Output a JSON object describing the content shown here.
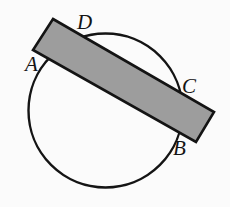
{
  "figure": {
    "background_color": "#fbfbfb",
    "stroke_color": "#141414",
    "labels": [
      {
        "id": "A",
        "text": "A",
        "x": 25,
        "y": 54
      },
      {
        "id": "B",
        "text": "B",
        "x": 173,
        "y": 138
      },
      {
        "id": "C",
        "text": "C",
        "x": 182,
        "y": 76
      },
      {
        "id": "D",
        "text": "D",
        "x": 77,
        "y": 12
      }
    ],
    "shapes": {
      "circle": {
        "name": "circle",
        "cx": 105.5,
        "cy": 110.5,
        "r": 77,
        "fill": "none",
        "stroke": "#141414",
        "stroke_width": 2.4
      },
      "rectangle": {
        "name": "shaded-rectangle",
        "fill": "#9d9d9d",
        "stroke": "#141414",
        "stroke_width": 2.6,
        "points": "53,19 214,112 196,142 33,50",
        "corners": [
          {
            "x": 53,
            "y": 19
          },
          {
            "x": 214,
            "y": 112
          },
          {
            "x": 196,
            "y": 142
          },
          {
            "x": 33,
            "y": 50
          }
        ]
      }
    }
  }
}
